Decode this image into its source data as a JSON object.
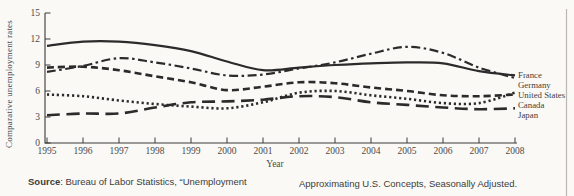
{
  "figure": {
    "background": "#faf9f6",
    "ink": "#2b2b2b",
    "page_edge_color": "#bcb8b1"
  },
  "chart_data": {
    "type": "line",
    "title": "",
    "xlabel": "Year",
    "ylabel": "Comparative unemployment rates",
    "x": [
      1995,
      1996,
      1997,
      1998,
      1999,
      2000,
      2001,
      2002,
      2003,
      2004,
      2005,
      2006,
      2007,
      2008
    ],
    "x_ticks": [
      "1995",
      "1996",
      "1997",
      "1998",
      "1999",
      "2000",
      "2001",
      "2002",
      "2003",
      "2004",
      "2005",
      "2006",
      "2007",
      "2008"
    ],
    "y_ticks": [
      0,
      3,
      6,
      9,
      12,
      15
    ],
    "ylim": [
      0,
      15
    ],
    "grid": false,
    "legend_position": "right-end-labels",
    "series": [
      {
        "name": "France",
        "style": "solid",
        "values": [
          11.2,
          11.7,
          11.7,
          11.3,
          10.6,
          9.4,
          8.4,
          8.7,
          9.0,
          9.2,
          9.3,
          9.2,
          8.3,
          7.8
        ]
      },
      {
        "name": "Germany",
        "style": "dash-dot",
        "values": [
          8.2,
          8.9,
          9.8,
          9.3,
          8.6,
          7.8,
          7.9,
          8.6,
          9.3,
          10.3,
          11.1,
          10.4,
          8.7,
          7.5
        ]
      },
      {
        "name": "United States",
        "style": "dotted",
        "values": [
          5.6,
          5.4,
          4.9,
          4.5,
          4.2,
          4.0,
          4.7,
          5.8,
          6.0,
          5.5,
          5.1,
          4.6,
          4.6,
          5.8
        ]
      },
      {
        "name": "Canada",
        "style": "dashed",
        "values": [
          8.7,
          8.8,
          8.4,
          7.7,
          7.0,
          6.1,
          6.5,
          7.0,
          6.9,
          6.4,
          6.0,
          5.5,
          5.4,
          5.6
        ]
      },
      {
        "name": "Japan",
        "style": "long-dash",
        "values": [
          3.2,
          3.4,
          3.4,
          4.1,
          4.7,
          4.8,
          5.0,
          5.4,
          5.3,
          4.7,
          4.4,
          4.1,
          3.9,
          4.0
        ]
      }
    ]
  },
  "footer": {
    "source_label": "Source",
    "source_text": ": Bureau of Labor Statistics, “Unemployment",
    "right_text": "Approximating U.S. Concepts, Seasonally Adjusted."
  }
}
